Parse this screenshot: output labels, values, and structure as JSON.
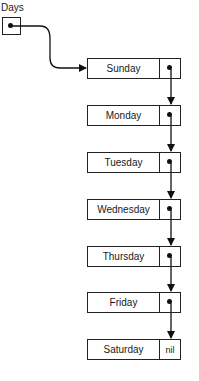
{
  "diagram": {
    "head": {
      "label": "Days"
    },
    "nodes": [
      {
        "value": "Sunday",
        "next": "pointer"
      },
      {
        "value": "Monday",
        "next": "pointer"
      },
      {
        "value": "Tuesday",
        "next": "pointer"
      },
      {
        "value": "Wednesday",
        "next": "pointer"
      },
      {
        "value": "Thursday",
        "next": "pointer"
      },
      {
        "value": "Friday",
        "next": "pointer"
      },
      {
        "value": "Saturday",
        "next": "nil"
      }
    ],
    "terminator_label": "nil"
  }
}
